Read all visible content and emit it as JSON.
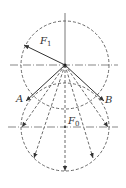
{
  "figure": {
    "labels": {
      "f1": "F",
      "f1_sub": "1",
      "f0": "F",
      "f0_sub": "0",
      "a": "A",
      "b": "B"
    },
    "colors": {
      "stroke": "#333333",
      "background": "#ffffff"
    },
    "upper_circle": {
      "cx": 65,
      "cy": 65,
      "r": 44
    },
    "lower_circle": {
      "cx": 65,
      "cy": 127,
      "r": 44
    }
  }
}
